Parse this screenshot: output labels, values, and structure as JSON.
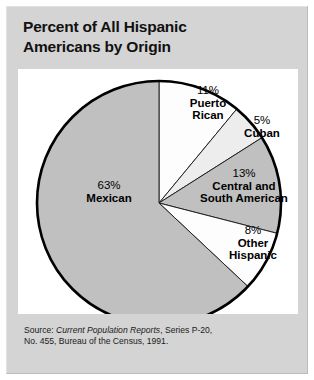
{
  "figure": {
    "title_line1": "Percent of All Hispanic",
    "title_line2": "Americans by Origin",
    "source_line1_prefix": "Source: ",
    "source_line1_italic": "Current Population Reports",
    "source_line1_suffix": ", Series P-20,",
    "source_line2": "No. 455, Bureau of the Census, 1991."
  },
  "chart_data": {
    "type": "pie",
    "title": "Percent of All Hispanic Americans by Origin",
    "xlabel": "",
    "ylabel": "",
    "legend_position": "none",
    "grid": false,
    "start_angle_deg": 0,
    "direction": "clockwise",
    "units": "percent",
    "categories": [
      "Puerto Rican",
      "Cuban",
      "Central and South American",
      "Other Hispanic",
      "Mexican"
    ],
    "values": [
      11,
      5,
      13,
      8,
      63
    ],
    "slices": [
      {
        "label": "Puerto Rican",
        "label_line1": "Puerto",
        "label_line2": "Rican",
        "value": 11,
        "percent_text": "11%",
        "color": "#fdfdfd"
      },
      {
        "label": "Cuban",
        "label_line1": "Cuban",
        "label_line2": "",
        "value": 5,
        "percent_text": "5%",
        "color": "#ededed"
      },
      {
        "label": "Central and South American",
        "label_line1": "Central and",
        "label_line2": "South American",
        "value": 13,
        "percent_text": "13%",
        "color": "#c0c0c0"
      },
      {
        "label": "Other Hispanic",
        "label_line1": "Other",
        "label_line2": "Hispanic",
        "value": 8,
        "percent_text": "8%",
        "color": "#fdfdfd"
      },
      {
        "label": "Mexican",
        "label_line1": "Mexican",
        "label_line2": "",
        "value": 63,
        "percent_text": "63%",
        "color": "#c0c0c0"
      }
    ],
    "colors": {
      "panel_background": "#d4d4d4",
      "plot_background": "#ffffff",
      "outline": "#000000",
      "text": "#000000"
    }
  }
}
